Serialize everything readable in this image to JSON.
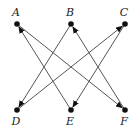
{
  "diagram": {
    "type": "directed-graph",
    "nodes": [
      {
        "id": "A",
        "label": "A",
        "x": 17,
        "y": 24,
        "label_pos": "above"
      },
      {
        "id": "B",
        "label": "B",
        "x": 71,
        "y": 24,
        "label_pos": "above"
      },
      {
        "id": "C",
        "label": "C",
        "x": 125,
        "y": 24,
        "label_pos": "above"
      },
      {
        "id": "D",
        "label": "D",
        "x": 17,
        "y": 110,
        "label_pos": "below"
      },
      {
        "id": "E",
        "label": "E",
        "x": 71,
        "y": 110,
        "label_pos": "below"
      },
      {
        "id": "F",
        "label": "F",
        "x": 125,
        "y": 110,
        "label_pos": "below"
      }
    ],
    "edges": [
      {
        "from": "A",
        "to": "F"
      },
      {
        "from": "E",
        "to": "A"
      },
      {
        "from": "B",
        "to": "D"
      },
      {
        "from": "F",
        "to": "B"
      },
      {
        "from": "D",
        "to": "C"
      },
      {
        "from": "C",
        "to": "E"
      }
    ],
    "colors": {
      "edge": "#555555",
      "node": "#111111",
      "label": "#222222"
    }
  }
}
